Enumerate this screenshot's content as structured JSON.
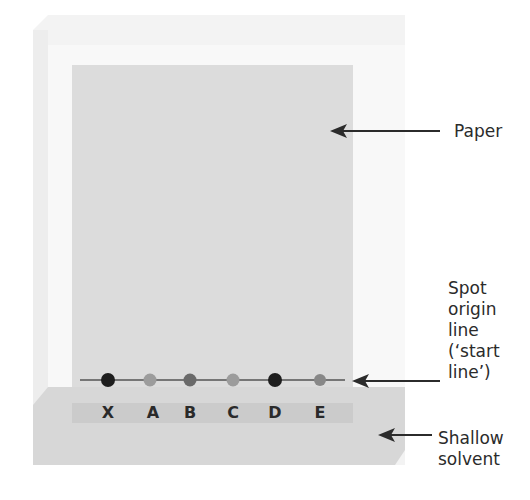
{
  "diagram": {
    "labels": {
      "paper": "Paper",
      "origin_line": [
        "Spot",
        "origin",
        "line",
        "(‘start",
        "line’)"
      ],
      "solvent": [
        "Shallow",
        "solvent"
      ]
    },
    "spots": [
      {
        "id": "X",
        "x": 108,
        "color": "#1e1e1e"
      },
      {
        "id": "A",
        "x": 150,
        "color": "#9a9a9a"
      },
      {
        "id": "B",
        "x": 190,
        "color": "#6a6a6a"
      },
      {
        "id": "C",
        "x": 233,
        "color": "#9a9a9a"
      },
      {
        "id": "D",
        "x": 275,
        "color": "#1e1e1e"
      },
      {
        "id": "E",
        "x": 320,
        "color": "#8a8a8a"
      }
    ],
    "colors": {
      "paper": "#dddddd",
      "tank_glass": "#f2f2f2",
      "tank_inner": "#f7f7f7",
      "solvent": "#d6d6d6",
      "solvent_band": "#cccccc",
      "line": "#555555",
      "arrow": "#2b2b2b"
    }
  }
}
